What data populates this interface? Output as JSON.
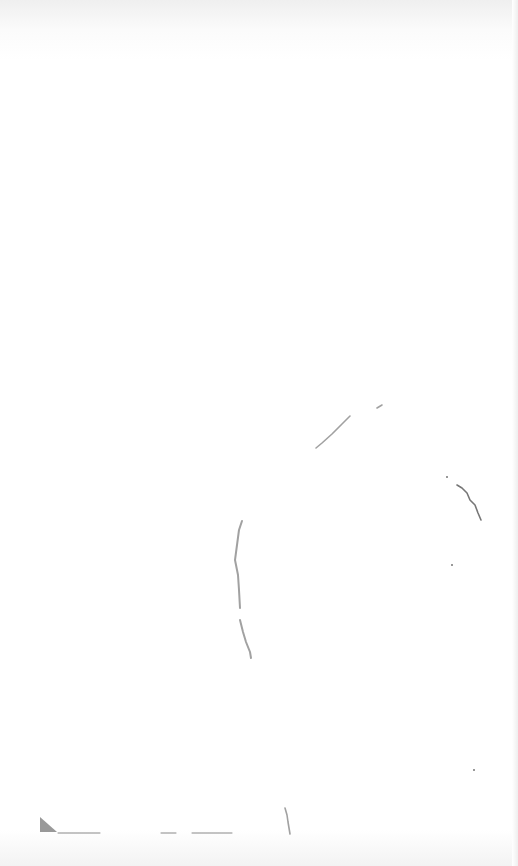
{
  "canvas": {
    "width": 518,
    "height": 866,
    "background": "#ffffff",
    "stroke_color": "#8a8a8a",
    "dark_stroke_color": "#555555"
  },
  "sketch": {
    "strokes": [
      {
        "name": "upper-diagonal-stroke",
        "points": "316,448 322,443 332,434 342,424 350,416"
      },
      {
        "name": "upper-small-mark",
        "points": "377,408 382,405"
      },
      {
        "name": "right-curve-stroke",
        "points": "457,485 462,488 467,493 470,500 475,505 478,513 481,520"
      },
      {
        "name": "left-arc-upper",
        "points": "242,521 239,530 237,545 235,560 238,575 239,590 240,608"
      },
      {
        "name": "left-arc-lower",
        "points": "240,620 243,632 246,642 250,652 251,658"
      },
      {
        "name": "bottom-vertical-stroke",
        "points": "285,808 287,815 288,822 290,834"
      }
    ],
    "corner_mark": {
      "name": "bottom-left-triangle",
      "points": "40,817 40,832 57,832"
    },
    "baselines": [
      {
        "x1": 58,
        "y1": 833,
        "x2": 100,
        "y2": 833
      },
      {
        "x1": 161,
        "y1": 833,
        "x2": 176,
        "y2": 833
      },
      {
        "x1": 192,
        "y1": 833,
        "x2": 232,
        "y2": 833
      }
    ],
    "dots": [
      {
        "cx": 447,
        "cy": 477
      },
      {
        "cx": 452,
        "cy": 565
      },
      {
        "cx": 474,
        "cy": 770
      }
    ]
  }
}
